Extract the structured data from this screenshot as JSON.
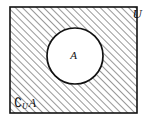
{
  "figure": {
    "name": "set-complement-venn-diagram",
    "canvas": {
      "width": 147,
      "height": 123,
      "background": "#ffffff"
    },
    "universe": {
      "label": "U",
      "shape": "rectangle",
      "x": 10,
      "y": 7,
      "width": 127,
      "height": 106,
      "stroke_color": "#111111",
      "stroke_width": 1.6,
      "fill": "hatched"
    },
    "hatching": {
      "angle_degrees": 45,
      "direction": "lower-left to upper-right",
      "spacing": 5,
      "line_width": 0.9,
      "color": "#1a1a1a"
    },
    "set_a": {
      "label": "A",
      "shape": "circle",
      "center_x": 75,
      "center_y": 56,
      "radius": 28,
      "stroke_color": "#111111",
      "stroke_width": 1.7,
      "fill_color": "#ffffff"
    },
    "complement_label": {
      "symbol": "∁",
      "subscript": "U",
      "argument": "A",
      "full_text": "∁UA",
      "meaning": "complement of A relative to U"
    }
  }
}
